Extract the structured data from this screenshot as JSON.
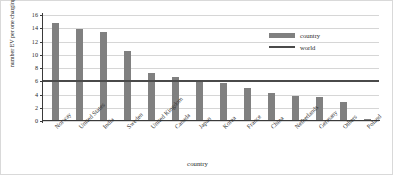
{
  "chart_data": {
    "type": "bar",
    "title": "",
    "xlabel": "country",
    "ylabel": "number EV per one charging station",
    "categories": [
      "Norway",
      "United States",
      "India",
      "Sweden",
      "United Kingdom",
      "Canada",
      "Japan",
      "Korea",
      "France",
      "China",
      "Netherlands",
      "Germany",
      "Others",
      "Poland"
    ],
    "values": [
      14.8,
      13.9,
      13.5,
      10.6,
      7.3,
      6.7,
      6.2,
      5.7,
      5.0,
      4.3,
      3.8,
      3.7,
      2.8,
      0.35
    ],
    "series": [
      {
        "name": "country",
        "type": "bar",
        "values": [
          14.8,
          13.9,
          13.5,
          10.6,
          7.3,
          6.7,
          6.2,
          5.7,
          5.0,
          4.3,
          3.8,
          3.7,
          2.8,
          0.35
        ]
      },
      {
        "name": "world",
        "type": "line",
        "value": 6.2
      }
    ],
    "world_reference_value": 6.2,
    "ylim": [
      0,
      16
    ],
    "yticks": [
      0,
      2,
      4,
      6,
      8,
      10,
      12,
      14,
      16
    ],
    "ytick_labels": [
      "0",
      "2",
      "4",
      "6",
      "8",
      "10",
      "12",
      "14",
      "16"
    ],
    "grid": true,
    "legend_position": "top-right",
    "legend": [
      {
        "label": "country",
        "marker": "bar",
        "color": "#808080"
      },
      {
        "label": "world",
        "marker": "line",
        "color": "#4a4a4a"
      }
    ],
    "colors": {
      "bar": "#808080",
      "line": "#4a4a4a",
      "grid": "#d6d6d6",
      "axis": "#3a3a3a",
      "background": "#ffffff",
      "frame": "#d9d9d9"
    }
  }
}
